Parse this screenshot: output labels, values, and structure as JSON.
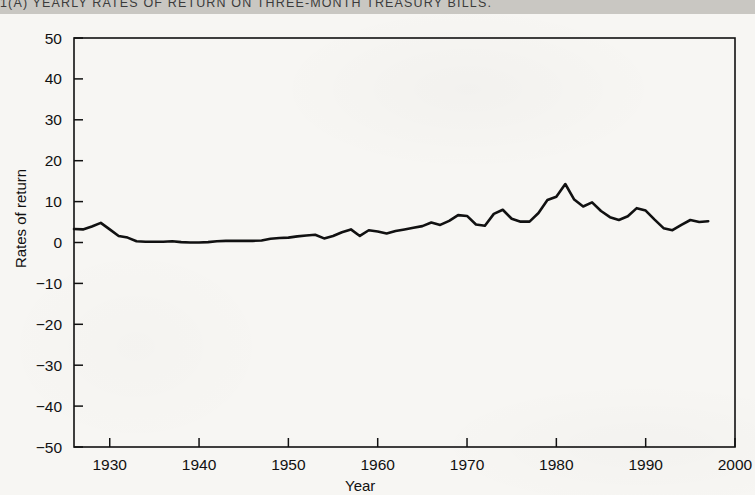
{
  "header": {
    "title": "1(A)  YEARLY RATES OF RETURN ON THREE-MONTH TREASURY BILLS."
  },
  "chart_data": {
    "type": "line",
    "title": "1(A)  YEARLY RATES OF RETURN ON THREE-MONTH TREASURY BILLS.",
    "xlabel": "Year",
    "ylabel": "Rates of return",
    "xlim": [
      1926,
      2000
    ],
    "ylim": [
      -50,
      50
    ],
    "grid": false,
    "legend": null,
    "xticks": [
      1930,
      1940,
      1950,
      1960,
      1970,
      1980,
      1990,
      2000
    ],
    "xtick_labels": [
      "1930",
      "1940",
      "1950",
      "1960",
      "1970",
      "1980",
      "1990",
      "2000"
    ],
    "yticks": [
      50,
      40,
      30,
      20,
      10,
      0,
      -10,
      -20,
      -30,
      -40,
      -50
    ],
    "ytick_labels": [
      "50",
      "40",
      "30",
      "20",
      "10",
      "0",
      "−10",
      "−20",
      "−30",
      "−40",
      "−50"
    ],
    "series": [
      {
        "name": "Three-month Treasury bills",
        "color": "#111111",
        "x": [
          1926,
          1927,
          1928,
          1929,
          1930,
          1931,
          1932,
          1933,
          1934,
          1935,
          1936,
          1937,
          1938,
          1939,
          1940,
          1941,
          1942,
          1943,
          1944,
          1945,
          1946,
          1947,
          1948,
          1949,
          1950,
          1951,
          1952,
          1953,
          1954,
          1955,
          1956,
          1957,
          1958,
          1959,
          1960,
          1961,
          1962,
          1963,
          1964,
          1965,
          1966,
          1967,
          1968,
          1969,
          1970,
          1971,
          1972,
          1973,
          1974,
          1975,
          1976,
          1977,
          1978,
          1979,
          1980,
          1981,
          1982,
          1983,
          1984,
          1985,
          1986,
          1987,
          1988,
          1989,
          1990,
          1991,
          1992,
          1993,
          1994,
          1995,
          1996,
          1997
        ],
        "values": [
          3.3,
          3.2,
          3.9,
          4.8,
          3.2,
          1.6,
          1.2,
          0.3,
          0.2,
          0.2,
          0.2,
          0.3,
          0.1,
          0.0,
          0.0,
          0.1,
          0.3,
          0.4,
          0.4,
          0.4,
          0.4,
          0.5,
          0.9,
          1.1,
          1.2,
          1.5,
          1.7,
          1.9,
          1.0,
          1.6,
          2.5,
          3.2,
          1.6,
          3.0,
          2.7,
          2.2,
          2.8,
          3.2,
          3.6,
          4.0,
          4.9,
          4.3,
          5.3,
          6.7,
          6.5,
          4.4,
          4.1,
          7.0,
          8.0,
          5.8,
          5.1,
          5.1,
          7.2,
          10.4,
          11.2,
          14.3,
          10.5,
          8.8,
          9.8,
          7.7,
          6.2,
          5.5,
          6.4,
          8.4,
          7.8,
          5.6,
          3.5,
          3.0,
          4.3,
          5.5,
          5.0,
          5.2
        ]
      }
    ]
  }
}
